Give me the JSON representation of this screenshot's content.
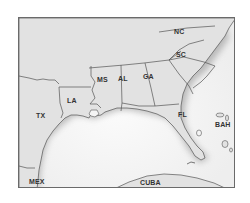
{
  "map": {
    "title": "",
    "colors": {
      "land": "#e2e2e2",
      "water": "#f4f4f4",
      "border": "#555555",
      "coast_shadow": "#9a9a9a",
      "frame": "#6a6a6a",
      "label": "#333333"
    },
    "labels": {
      "nc": "NC",
      "sc": "SC",
      "ga": "GA",
      "al": "AL",
      "ms": "MS",
      "la": "LA",
      "tx": "TX",
      "fl": "FL",
      "bah": "BAH",
      "mex": "MEX",
      "cuba": "CUBA"
    },
    "regions": [
      {
        "id": "nc",
        "name": "NC",
        "type": "state"
      },
      {
        "id": "sc",
        "name": "SC",
        "type": "state"
      },
      {
        "id": "ga",
        "name": "GA",
        "type": "state"
      },
      {
        "id": "al",
        "name": "AL",
        "type": "state"
      },
      {
        "id": "ms",
        "name": "MS",
        "type": "state"
      },
      {
        "id": "la",
        "name": "LA",
        "type": "state"
      },
      {
        "id": "tx",
        "name": "TX",
        "type": "state"
      },
      {
        "id": "fl",
        "name": "FL",
        "type": "state"
      },
      {
        "id": "bah",
        "name": "BAH",
        "type": "country"
      },
      {
        "id": "mex",
        "name": "MEX",
        "type": "country"
      },
      {
        "id": "cuba",
        "name": "CUBA",
        "type": "country"
      }
    ]
  }
}
